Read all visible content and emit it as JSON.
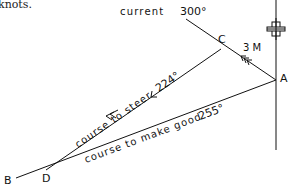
{
  "header_fragment": "knots.",
  "points": {
    "A": {
      "label": "A",
      "x": 276,
      "y": 80
    },
    "B": {
      "label": "B",
      "x": 16,
      "y": 178
    },
    "C": {
      "label": "C",
      "x": 221,
      "y": 49
    },
    "D": {
      "label": "D",
      "x": 46,
      "y": 170
    }
  },
  "current": {
    "label": "current",
    "bearing": "300°",
    "distance": "3 M"
  },
  "course_to_steer": {
    "label": "course to steer",
    "bearing": "224°"
  },
  "course_to_make_good": {
    "label": "course to make good",
    "bearing": "255°"
  },
  "north_marker": "north-cross",
  "colors": {
    "ink": "#111111",
    "background": "#ffffff"
  }
}
